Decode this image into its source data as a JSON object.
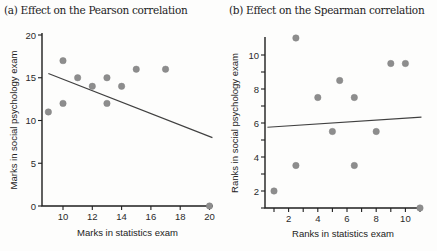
{
  "figure": {
    "background": "#fdfdfc"
  },
  "chart_data": [
    {
      "type": "scatter",
      "title": "(a) Effect on the Pearson correlation",
      "xlabel": "Marks in statistics exam",
      "ylabel": "Marks in social psychology exam",
      "xtick_values": [
        10,
        12,
        14,
        16,
        18,
        20
      ],
      "xtick_labels": [
        "10",
        "12",
        "14",
        "16",
        "18",
        "20"
      ],
      "ytick_values": [
        0,
        5,
        10,
        15,
        20
      ],
      "ytick_labels": [
        "0",
        "5",
        "10",
        "15",
        "20"
      ],
      "xlim": [
        8.6,
        20.3
      ],
      "ylim": [
        0,
        20.3
      ],
      "grid": false,
      "legend": false,
      "points": [
        [
          9,
          11
        ],
        [
          10,
          17
        ],
        [
          10,
          12
        ],
        [
          11,
          15
        ],
        [
          12,
          14
        ],
        [
          13,
          15
        ],
        [
          13,
          12
        ],
        [
          14,
          14
        ],
        [
          15,
          16
        ],
        [
          17,
          16
        ],
        [
          20,
          0
        ]
      ],
      "fit_line": {
        "x1": 9,
        "y1": 15.5,
        "x2": 20.2,
        "y2": 8.0
      },
      "colors": {
        "point": "#8d8d8d",
        "point_edge": "#848484",
        "line": "#404040",
        "axis": "#1f1f1f",
        "text": "#2a2a2a"
      }
    },
    {
      "type": "scatter",
      "title": "(b) Effect on the Spearman correlation",
      "xlabel": "Ranks in statistics exam",
      "ylabel": "Ranks in social psychology exam",
      "xtick_values": [
        1,
        2,
        3,
        4,
        5,
        6,
        7,
        8,
        9,
        10,
        11
      ],
      "xtick_labels": [
        "",
        "2",
        "",
        "4",
        "",
        "6",
        "",
        "8",
        "",
        "10",
        ""
      ],
      "ytick_values": [
        1,
        2,
        3,
        4,
        5,
        6,
        7,
        8,
        9,
        10
      ],
      "ytick_labels": [
        "",
        "2",
        "",
        "4",
        "",
        "6",
        "",
        "8",
        "",
        "10"
      ],
      "xlim": [
        0.4,
        11.1
      ],
      "ylim": [
        1,
        11
      ],
      "grid": false,
      "legend": false,
      "points": [
        [
          1,
          2
        ],
        [
          2.5,
          11
        ],
        [
          2.5,
          3.5
        ],
        [
          4,
          7.5
        ],
        [
          5,
          5.5
        ],
        [
          5.5,
          8.5
        ],
        [
          6.5,
          7.5
        ],
        [
          6.5,
          3.5
        ],
        [
          8,
          5.5
        ],
        [
          9,
          9.5
        ],
        [
          10,
          9.5
        ],
        [
          11,
          1
        ]
      ],
      "fit_line": {
        "x1": 0.55,
        "y1": 5.75,
        "x2": 11.1,
        "y2": 6.35
      },
      "colors": {
        "point": "#8d8d8d",
        "point_edge": "#848484",
        "line": "#404040",
        "axis": "#1f1f1f",
        "text": "#2a2a2a"
      }
    }
  ]
}
